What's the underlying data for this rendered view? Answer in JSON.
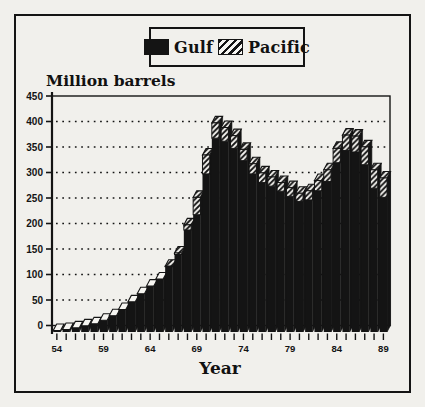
{
  "page": {
    "paper_color": "#f1f0ec",
    "ink_color": "#141414"
  },
  "legend": {
    "items": [
      {
        "label": "Gulf",
        "swatch": "solid-black-square"
      },
      {
        "label": "Pacific",
        "swatch": "diagonal-hatch-square"
      }
    ]
  },
  "chart_data": {
    "type": "bar",
    "stacked": true,
    "style": "3d-offset scanned print, black ink on paper",
    "title": "Million barrels",
    "xlabel": "Year",
    "ylabel": "Million barrels",
    "x": [
      54,
      55,
      56,
      57,
      58,
      59,
      60,
      61,
      62,
      63,
      64,
      65,
      66,
      67,
      68,
      69,
      70,
      71,
      72,
      73,
      74,
      75,
      76,
      77,
      78,
      79,
      80,
      81,
      82,
      83,
      84,
      85,
      86,
      87,
      88,
      89
    ],
    "series": [
      {
        "name": "Gulf",
        "fill": "solid-black",
        "values": [
          3,
          5,
          8,
          12,
          16,
          23,
          32,
          44,
          59,
          75,
          90,
          104,
          128,
          152,
          200,
          230,
          310,
          380,
          374,
          360,
          336,
          310,
          293,
          286,
          276,
          266,
          256,
          259,
          277,
          295,
          332,
          356,
          353,
          328,
          282,
          264
        ]
      },
      {
        "name": "Pacific",
        "fill": "diagonal-hatch",
        "values": [
          0,
          0,
          0,
          0,
          0,
          0,
          0,
          0,
          0,
          0,
          0,
          0,
          1,
          3,
          10,
          34,
          37,
          30,
          27,
          25,
          22,
          20,
          19,
          18,
          17,
          17,
          16,
          18,
          20,
          23,
          28,
          30,
          31,
          35,
          36,
          38
        ]
      }
    ],
    "ylim": [
      0,
      450
    ],
    "ytick_step": 50,
    "ytick_labels": [
      "0",
      "50",
      "100",
      "150",
      "200",
      "250",
      "300",
      "350",
      "400",
      "450"
    ],
    "xtick_labels": [
      "54",
      "59",
      "64",
      "69",
      "74",
      "79",
      "84",
      "89"
    ],
    "grid": "dotted horizontal gridlines every 50",
    "legend_position": "top-center boxed"
  }
}
